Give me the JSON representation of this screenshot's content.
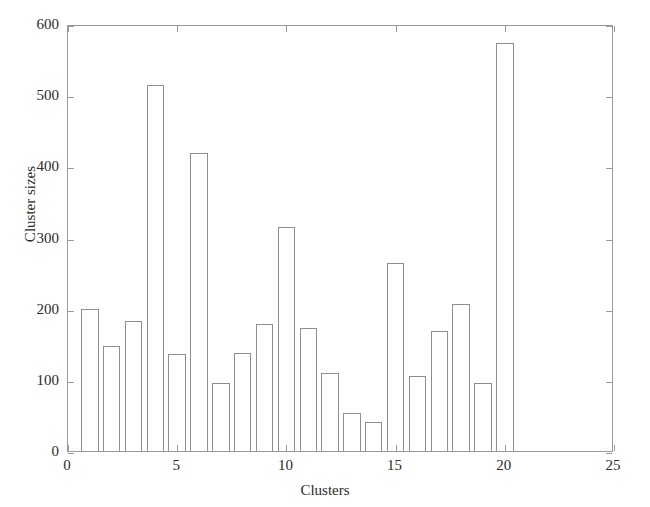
{
  "chart_data": {
    "type": "bar",
    "title": "",
    "xlabel": "Clusters",
    "ylabel": "Cluster sizes",
    "categories": [
      1,
      2,
      3,
      4,
      5,
      6,
      7,
      8,
      9,
      10,
      11,
      12,
      13,
      14,
      15,
      16,
      17,
      18,
      19,
      20
    ],
    "values": [
      200,
      148,
      183,
      514,
      137,
      419,
      96,
      138,
      178,
      315,
      173,
      110,
      54,
      41,
      264,
      105,
      168,
      207,
      95,
      573
    ],
    "xlim": [
      0,
      25
    ],
    "ylim": [
      0,
      600
    ],
    "xticks": [
      0,
      5,
      10,
      15,
      20,
      25
    ],
    "yticks": [
      0,
      100,
      200,
      300,
      400,
      500,
      600
    ],
    "xtick_labels": [
      "0",
      "5",
      "10",
      "15",
      "20",
      "25"
    ],
    "ytick_labels": [
      "0",
      "100",
      "200",
      "300",
      "400",
      "500",
      "600"
    ],
    "grid": false,
    "legend": null,
    "bar_width": 0.8,
    "bar_fill_color": "#ffffff",
    "bar_edge_color": "#8e8e8e",
    "axes_color": "#9a9a9a",
    "background_color": "#ffffff"
  }
}
